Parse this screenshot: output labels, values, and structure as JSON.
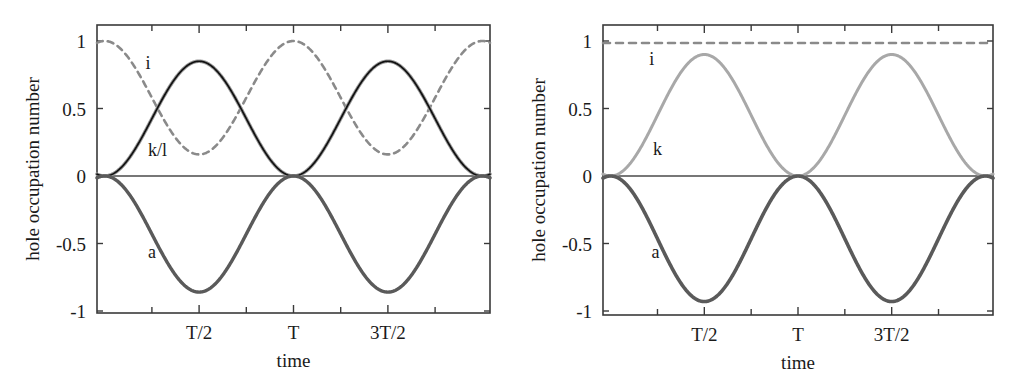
{
  "figure": {
    "title": "",
    "panel_count": 2
  },
  "chart_data": [
    {
      "type": "line",
      "panel": "left",
      "title": "",
      "xlabel": "time",
      "ylabel": "hole occupation number",
      "xlim": [
        -0.0408,
        2.0408
      ],
      "ylim": [
        -1,
        1
      ],
      "grid": false,
      "legend": "inline-curve-labels",
      "xticks_major_values": [
        0.5,
        1.0,
        1.5
      ],
      "xticks_major_labels": [
        "T/2",
        "T",
        "3T/2"
      ],
      "xticks_minor_values": [
        0.25,
        0.75,
        1.25,
        1.75
      ],
      "yticks_values": [
        1,
        0.5,
        0,
        -0.5,
        -1
      ],
      "yticks_labels": [
        "1",
        "0.5",
        "0",
        "-0.5",
        "-1"
      ],
      "series": [
        {
          "name": "i",
          "label": "i",
          "style": "dashed",
          "color": "#8a8a8a",
          "width": 2.6,
          "dash": "6,5",
          "label_x": 0.23,
          "label_y": 0.84,
          "form": "cos2_offset",
          "amplitude": 0.42,
          "offset": 0.58,
          "period": 1.0,
          "phase": 0.0,
          "min": 0.16,
          "max": 1.0,
          "values_at_labeled_ticks": [
            0.16,
            1.0,
            0.16
          ]
        },
        {
          "name": "k/l",
          "label": "k/l",
          "style": "solid",
          "color": "#9a9a9a",
          "width": 3.6,
          "dash": "",
          "label_x": 0.28,
          "label_y": 0.19,
          "form": "sin2",
          "amplitude": 0.85,
          "offset": 0.0,
          "period": 1.0,
          "phase": 0.0,
          "min": 0.0,
          "max": 0.85,
          "values_at_labeled_ticks": [
            0.85,
            0.0,
            0.85
          ]
        },
        {
          "name": "k/l-overlay",
          "label": "",
          "style": "solid",
          "color": "#111111",
          "width": 1.7,
          "dash": "",
          "label_x": null,
          "label_y": null,
          "form": "sin2",
          "amplitude": 0.85,
          "offset": 0.0,
          "period": 1.0,
          "phase": 0.0,
          "min": 0.0,
          "max": 0.85,
          "values_at_labeled_ticks": [
            0.85,
            0.0,
            0.85
          ]
        },
        {
          "name": "a",
          "label": "a",
          "style": "solid",
          "color": "#5a5a5a",
          "width": 3.4,
          "dash": "",
          "label_x": 0.25,
          "label_y": -0.565,
          "form": "neg_sin2",
          "amplitude": 0.86,
          "offset": 0.0,
          "period": 1.0,
          "phase": 0.0,
          "min": -0.86,
          "max": 0.0,
          "values_at_labeled_ticks": [
            -0.86,
            0.0,
            -0.86
          ]
        }
      ]
    },
    {
      "type": "line",
      "panel": "right",
      "title": "",
      "xlabel": "time",
      "ylabel": "hole occupation number",
      "xlim": [
        -0.0408,
        2.0408
      ],
      "ylim": [
        -1,
        1
      ],
      "grid": false,
      "legend": "inline-curve-labels",
      "xticks_major_values": [
        0.5,
        1.0,
        1.5
      ],
      "xticks_major_labels": [
        "T/2",
        "T",
        "3T/2"
      ],
      "xticks_minor_values": [
        0.25,
        0.75,
        1.25,
        1.75
      ],
      "yticks_values": [
        1,
        0.5,
        0,
        -0.5,
        -1
      ],
      "yticks_labels": [
        "1",
        "0.5",
        "0",
        "-0.5",
        "-1"
      ],
      "series": [
        {
          "name": "i",
          "label": "i",
          "style": "dashed",
          "color": "#8a8a8a",
          "width": 2.6,
          "dash": "7,6",
          "label_x": 0.22,
          "label_y": 0.87,
          "form": "constant",
          "amplitude": 0.0,
          "offset": 0.985,
          "period": 1.0,
          "phase": 0.0,
          "min": 0.985,
          "max": 0.985,
          "values_at_labeled_ticks": [
            0.985,
            0.985,
            0.985
          ]
        },
        {
          "name": "k",
          "label": "k",
          "style": "solid",
          "color": "#a8a8a8",
          "width": 3.0,
          "dash": "",
          "label_x": 0.25,
          "label_y": 0.2,
          "form": "sin2",
          "amplitude": 0.9,
          "offset": 0.0,
          "period": 1.0,
          "phase": 0.0,
          "min": 0.0,
          "max": 0.9,
          "values_at_labeled_ticks": [
            0.9,
            0.0,
            0.9
          ]
        },
        {
          "name": "a",
          "label": "a",
          "style": "solid",
          "color": "#5a5a5a",
          "width": 3.6,
          "dash": "",
          "label_x": 0.24,
          "label_y": -0.565,
          "form": "neg_sin2",
          "amplitude": 0.93,
          "offset": 0.0,
          "period": 1.0,
          "phase": 0.0,
          "min": -0.93,
          "max": 0.0,
          "values_at_labeled_ticks": [
            -0.93,
            0.0,
            -0.93
          ]
        }
      ]
    }
  ],
  "geometry": {
    "left": {
      "x0": 97,
      "x1": 490,
      "y_top": 25,
      "y_bottom": 313,
      "y_zero": 176,
      "y_one": 41
    },
    "right": {
      "x0": 603,
      "x1": 993,
      "y_top": 25,
      "y_bottom": 315,
      "y_zero": 176,
      "y_one": 41
    }
  }
}
